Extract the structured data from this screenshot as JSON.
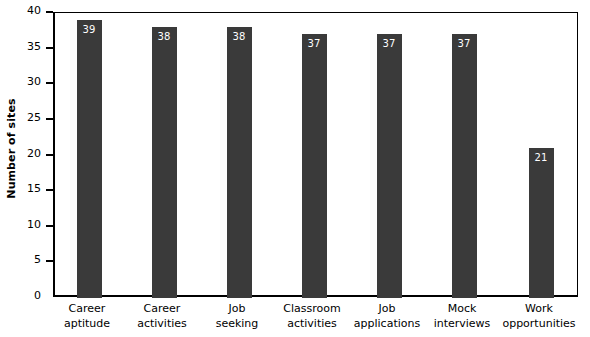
{
  "chart_data": {
    "type": "bar",
    "title": "",
    "subtitle": "",
    "xlabel": "",
    "ylabel": "Number of sites",
    "ylim": [
      0,
      40
    ],
    "ytick_labels": [
      "0",
      "5",
      "10",
      "15",
      "20",
      "25",
      "30",
      "35",
      "40"
    ],
    "ytick_values": [
      0,
      5,
      10,
      15,
      20,
      25,
      30,
      35,
      40
    ],
    "grid": false,
    "legend": false,
    "bar_color": "#3a3a3a",
    "value_label_color": "#ffffff",
    "axis_color": "#000000",
    "background": "#ffffff",
    "categories": [
      "Career aptitude",
      "Career activities",
      "Job seeking",
      "Classroom activities",
      "Job applications",
      "Mock interviews",
      "Work opportunities"
    ],
    "category_lines": [
      [
        "Career",
        "aptitude"
      ],
      [
        "Career",
        "activities"
      ],
      [
        "Job",
        "seeking"
      ],
      [
        "Classroom",
        "activities"
      ],
      [
        "Job",
        "applications"
      ],
      [
        "Mock",
        "interviews"
      ],
      [
        "Work",
        "opportunities"
      ]
    ],
    "values": [
      39,
      38,
      38,
      37,
      37,
      37,
      21
    ],
    "value_labels": [
      "39",
      "38",
      "38",
      "37",
      "37",
      "37",
      "21"
    ]
  }
}
